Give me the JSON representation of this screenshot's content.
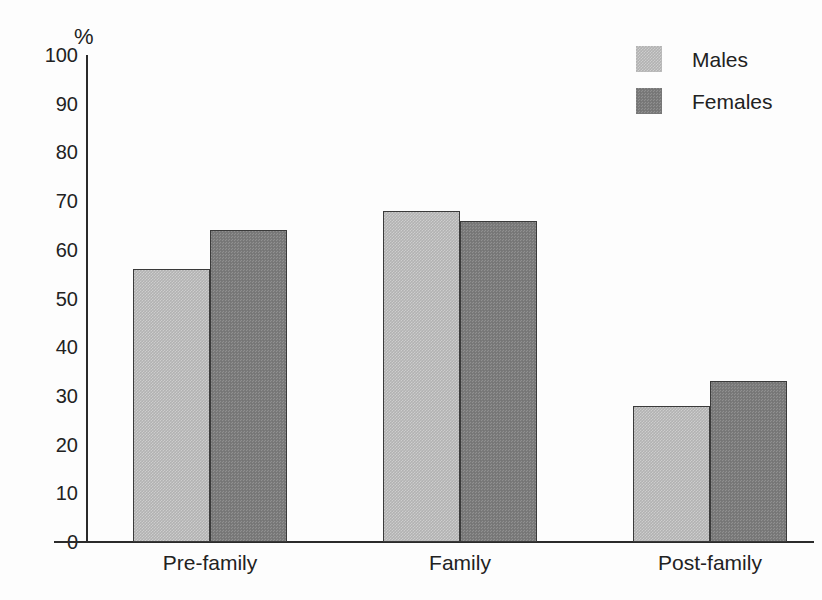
{
  "chart_data": {
    "type": "bar",
    "title": "",
    "subtitle": "",
    "xlabel": "",
    "ylabel": "%",
    "ylim": [
      0,
      100
    ],
    "yticks": [
      0,
      10,
      20,
      30,
      40,
      50,
      60,
      70,
      80,
      90,
      100
    ],
    "ytick_labels": [
      "0",
      "10",
      "20",
      "30",
      "40",
      "50",
      "60",
      "70",
      "80",
      "90",
      "100"
    ],
    "grid": false,
    "legend_position": "top-right",
    "categories": [
      "Pre-family",
      "Family",
      "Post-family"
    ],
    "series": [
      {
        "name": "Males",
        "color": "#b2b2b2",
        "values": [
          56,
          68,
          28
        ]
      },
      {
        "name": "Females",
        "color": "#7b7b7b",
        "values": [
          64,
          66,
          33
        ]
      }
    ]
  },
  "legend": {
    "items": [
      {
        "label": "Males"
      },
      {
        "label": "Females"
      }
    ]
  },
  "axis": {
    "unit_label": "%"
  }
}
